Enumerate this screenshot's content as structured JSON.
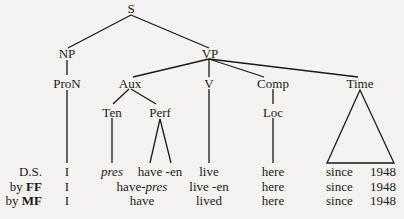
{
  "tree": {
    "root": "S",
    "nodes": {
      "S": "S",
      "NP": "NP",
      "VP": "VP",
      "ProN": "ProN",
      "Aux": "Aux",
      "V": "V",
      "Comp": "Comp",
      "Time": "Time",
      "Ten": "Ten",
      "Perf": "Perf",
      "Loc": "Loc"
    }
  },
  "rows": [
    {
      "label": "D.S.",
      "label_bold": "",
      "cells": {
        "pron": "I",
        "ten": "pres",
        "perf": "have -en",
        "v": "live",
        "loc": "here",
        "since": "since",
        "year": "1948"
      }
    },
    {
      "label": "by ",
      "label_bold": "FF",
      "cells": {
        "pron": "I",
        "aux_a": "have-",
        "aux_b": "pres",
        "v": "live -en",
        "loc": "here",
        "since": "since",
        "year": "1948"
      }
    },
    {
      "label": "by ",
      "label_bold": "MF",
      "cells": {
        "pron": "I",
        "aux": "have",
        "v": "lived",
        "loc": "here",
        "since": "since",
        "year": "1948"
      }
    }
  ]
}
